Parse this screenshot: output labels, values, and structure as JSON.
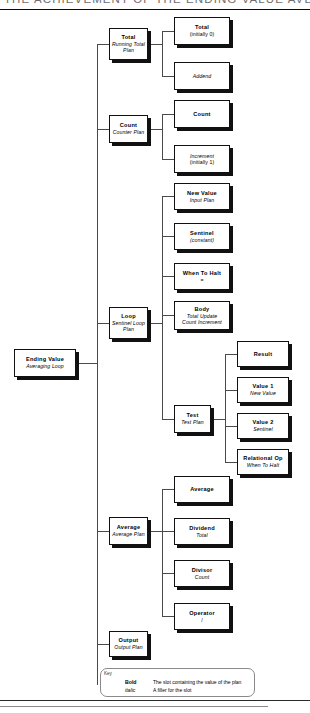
{
  "page": {
    "header_title": "THE ACHIEVEMENT OF THE ENDING VALUE AVERAGING LOOP",
    "background": "#ffffff",
    "line_color": "#4a4a4a",
    "box_border": "#111111",
    "shadow_color": "#111111"
  },
  "diagram": {
    "type": "tree",
    "root": {
      "id": "root",
      "bold_label": "Ending Value",
      "italic_label": "Averaging Loop"
    },
    "branches": [
      {
        "id": "total-plan",
        "bold_label": "Total",
        "italic_label": "Running Total",
        "italic_label2": "Plan",
        "children": [
          {
            "id": "total-slot",
            "bold_label": "Total",
            "normal_label": "(initially 0)"
          },
          {
            "id": "addend-slot",
            "italic_label": "Addend"
          }
        ]
      },
      {
        "id": "count-plan",
        "bold_label": "Count",
        "italic_label": "Counter Plan",
        "children": [
          {
            "id": "count-slot",
            "bold_label": "Count"
          },
          {
            "id": "increment-slot",
            "italic_label": "Increment",
            "normal_label": "(initially 1)"
          }
        ]
      },
      {
        "id": "loop-plan",
        "bold_label": "Loop",
        "italic_label": "Sentinel Loop",
        "italic_label2": "Plan",
        "children": [
          {
            "id": "new-value-slot",
            "bold_label": "New Value",
            "italic_label": "Input Plan"
          },
          {
            "id": "sentinel-slot",
            "bold_label": "Sentinel",
            "italic_label": "(constant)"
          },
          {
            "id": "when-to-halt-slot",
            "bold_label": "When To Halt",
            "normal_label": "="
          },
          {
            "id": "body-slot",
            "bold_label": "Body",
            "italic_label": "Total Update",
            "italic_label2": "Count Increment"
          },
          {
            "id": "test-slot",
            "bold_label": "Test",
            "italic_label": "Test Plan",
            "children": [
              {
                "id": "result-slot",
                "bold_label": "Result"
              },
              {
                "id": "value1-slot",
                "bold_label": "Value 1",
                "italic_label": "New Value"
              },
              {
                "id": "value2-slot",
                "bold_label": "Value 2",
                "italic_label": "Sentinel"
              },
              {
                "id": "relop-slot",
                "bold_label": "Relational Op",
                "italic_label": "When To Halt"
              }
            ]
          }
        ]
      },
      {
        "id": "average-plan",
        "bold_label": "Average",
        "italic_label": "Average Plan",
        "children": [
          {
            "id": "average-slot",
            "bold_label": "Average"
          },
          {
            "id": "dividend-slot",
            "bold_label": "Dividend",
            "italic_label": "Total"
          },
          {
            "id": "divisor-slot",
            "bold_label": "Divisor",
            "italic_label": "Count"
          },
          {
            "id": "operator-slot",
            "bold_label": "Operator",
            "normal_label": "/"
          }
        ]
      },
      {
        "id": "output-plan",
        "bold_label": "Output",
        "italic_label": "Output Plan"
      }
    ]
  },
  "key": {
    "title": "Key",
    "rows": [
      {
        "term": "Bold",
        "desc": "The slot containing the value of the plan"
      },
      {
        "term": "italic",
        "desc": "A filler for the slot"
      }
    ]
  }
}
